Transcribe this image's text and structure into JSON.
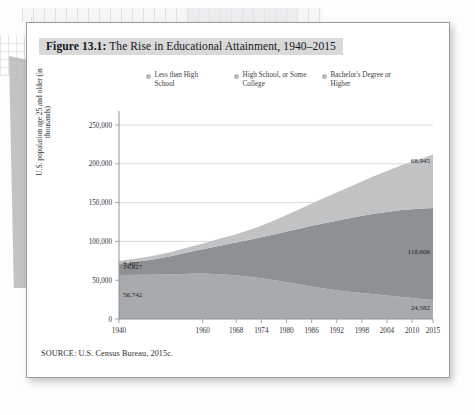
{
  "figure": {
    "label": "Figure 13.1:",
    "title": " The Rise in Educational Attainment, 1940–2015",
    "source": "SOURCE: U.S. Census Bureau, 2015c."
  },
  "colors": {
    "less_than_hs": "#a8abad",
    "hs_some_college": "#8e9193",
    "bachelors_or_higher": "#c0c2c3",
    "legend_dot": "#b9bbbd",
    "grid": "#c9ccd0",
    "axis": "#8e9196",
    "title_highlight": "#d9d9d9",
    "card_border": "#9b9b9b"
  },
  "legend": {
    "items": [
      {
        "label": "Less than High School",
        "key": "less_than_hs"
      },
      {
        "label": "High School, or Some College",
        "key": "hs_some_college"
      },
      {
        "label": "Bachelor's Degree or Higher",
        "key": "bachelors_or_higher"
      }
    ]
  },
  "chart_data": {
    "type": "area",
    "stacked": true,
    "title": "The Rise in Educational Attainment, 1940–2015",
    "xlabel": "",
    "ylabel": "U.S. population age 25 and older (in thousands)",
    "xlim": [
      1940,
      2015
    ],
    "ylim": [
      0,
      250000
    ],
    "yticks": [
      0,
      50000,
      100000,
      150000,
      200000,
      250000
    ],
    "ytick_labels": [
      "0",
      "50,000",
      "100,000",
      "150,000",
      "200,000",
      "250,000"
    ],
    "xticks": [
      1940,
      1960,
      1968,
      1974,
      1980,
      1986,
      1992,
      1998,
      2004,
      2010,
      2015
    ],
    "xtick_labels": [
      "1940",
      "1960",
      "1968",
      "1974",
      "1980",
      "1986",
      "1992",
      "1998",
      "2004",
      "2010",
      "2015"
    ],
    "grid": true,
    "legend_position": "top",
    "x": [
      1940,
      1947,
      1952,
      1957,
      1960,
      1964,
      1968,
      1970,
      1974,
      1977,
      1980,
      1983,
      1986,
      1989,
      1992,
      1995,
      1998,
      2001,
      2004,
      2007,
      2010,
      2013,
      2015
    ],
    "series": [
      {
        "name": "Less than High School",
        "key": "less_than_hs",
        "color": "#a8abad",
        "stack_order": 1,
        "values": [
          56742,
          56900,
          57400,
          58200,
          58600,
          57800,
          56400,
          55200,
          52600,
          50100,
          47400,
          44600,
          41800,
          39300,
          37100,
          35200,
          33400,
          31800,
          30200,
          28700,
          27200,
          25600,
          24582
        ]
      },
      {
        "name": "High School, or Some College",
        "key": "hs_some_college",
        "color": "#8e9193",
        "stack_order": 2,
        "values": [
          14627,
          18900,
          23100,
          28400,
          31300,
          36700,
          42200,
          45500,
          52600,
          58900,
          65300,
          71800,
          78400,
          84200,
          89600,
          94700,
          99600,
          103900,
          107800,
          111400,
          114200,
          116800,
          118606
        ]
      },
      {
        "name": "Bachelor's Degree or Higher",
        "key": "bachelors_or_higher",
        "color": "#c0c2c3",
        "stack_order": 3,
        "values": [
          3407,
          4300,
          5200,
          6400,
          7200,
          8800,
          10700,
          12100,
          15000,
          17900,
          21200,
          24800,
          28600,
          32400,
          36300,
          40100,
          44200,
          48500,
          52800,
          57200,
          61400,
          65600,
          68945
        ]
      }
    ],
    "annotations": [
      {
        "text": "3,407",
        "series": "bachelors_or_higher",
        "side": "left",
        "year": 1940,
        "value": 3407
      },
      {
        "text": "14,627",
        "series": "hs_some_college",
        "side": "left",
        "year": 1940,
        "value": 14627
      },
      {
        "text": "56,742",
        "series": "less_than_hs",
        "side": "left",
        "year": 1940,
        "value": 56742
      },
      {
        "text": "68,945",
        "series": "bachelors_or_higher",
        "side": "right",
        "year": 2015,
        "value": 68945
      },
      {
        "text": "118,606",
        "series": "hs_some_college",
        "side": "right",
        "year": 2015,
        "value": 118606
      },
      {
        "text": "24,582",
        "series": "less_than_hs",
        "side": "right",
        "year": 2015,
        "value": 24582
      }
    ]
  }
}
